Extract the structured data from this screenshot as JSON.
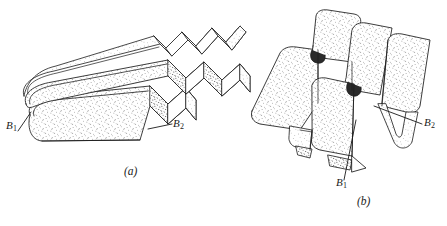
{
  "figure": {
    "kind": "technical-line-drawing",
    "background_color": "#ffffff",
    "ink_color": "#1a1a1a",
    "stipple_color": "#555555",
    "panels": [
      {
        "id": "a",
        "caption": "(a)",
        "labels": [
          {
            "id": "a-b1",
            "base": "B",
            "subscript": "1",
            "text": "B1"
          },
          {
            "id": "a-b2",
            "base": "B",
            "subscript": "2",
            "text": "B2"
          }
        ]
      },
      {
        "id": "b",
        "caption": "(b)",
        "labels": [
          {
            "id": "b-b1",
            "base": "B",
            "subscript": "1",
            "text": "B1"
          },
          {
            "id": "b-b2",
            "base": "B",
            "subscript": "2",
            "text": "B2"
          }
        ]
      }
    ]
  }
}
